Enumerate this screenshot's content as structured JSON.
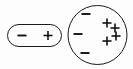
{
  "diagram": {
    "background_color": "#fdfdfd",
    "stroke_color": "#1a1a1a",
    "charge_color": "#111111",
    "objects": [
      {
        "id": "capsule",
        "name": "charged-rod",
        "shape": "rounded-rectangle",
        "x": 7,
        "y": 24,
        "width": 55,
        "height": 23,
        "corner_radius": 11.5,
        "charges": [
          {
            "sign": "−",
            "label": "minus",
            "cx": 22,
            "cy": 35.5,
            "size": 9
          },
          {
            "sign": "+",
            "label": "plus",
            "cx": 48,
            "cy": 35.5,
            "size": 9
          }
        ]
      },
      {
        "id": "sphere",
        "name": "charged-sphere",
        "shape": "circle",
        "cx": 97.5,
        "cy": 35,
        "r": 30,
        "charges": [
          {
            "sign": "−",
            "label": "minus",
            "cx": 86,
            "cy": 14,
            "size": 9
          },
          {
            "sign": "−",
            "label": "minus",
            "cx": 78,
            "cy": 34,
            "size": 9
          },
          {
            "sign": "−",
            "label": "minus",
            "cx": 85,
            "cy": 53,
            "size": 9
          },
          {
            "sign": "+",
            "label": "plus",
            "cx": 107,
            "cy": 23,
            "size": 9
          },
          {
            "sign": "+",
            "label": "plus",
            "cx": 115,
            "cy": 28,
            "size": 9
          },
          {
            "sign": "+",
            "label": "plus",
            "cx": 116,
            "cy": 36,
            "size": 9
          },
          {
            "sign": "+",
            "label": "plus",
            "cx": 107,
            "cy": 41,
            "size": 9
          }
        ]
      }
    ]
  }
}
